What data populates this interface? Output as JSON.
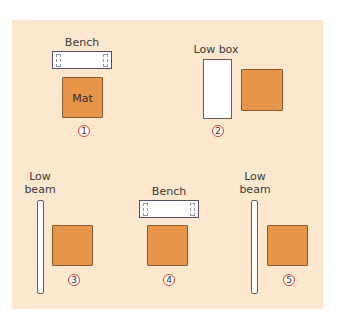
{
  "colors": {
    "panel_bg": "#fde8cf",
    "mat_fill": "#e8944a",
    "mat_border": "#8a5a30",
    "equipment_fill": "#ffffff",
    "number_circle": "#d0453a"
  },
  "stations": [
    {
      "number": "1",
      "equipment_label": "Bench",
      "equipment_type": "bench",
      "mat_label": "Mat"
    },
    {
      "number": "2",
      "equipment_label": "Low box",
      "equipment_type": "low-box",
      "mat_label": ""
    },
    {
      "number": "3",
      "equipment_label": "Low\nbeam",
      "equipment_type": "low-beam",
      "mat_label": ""
    },
    {
      "number": "4",
      "equipment_label": "Bench",
      "equipment_type": "bench",
      "mat_label": ""
    },
    {
      "number": "5",
      "equipment_label": "Low\nbeam",
      "equipment_type": "low-beam",
      "mat_label": ""
    }
  ]
}
